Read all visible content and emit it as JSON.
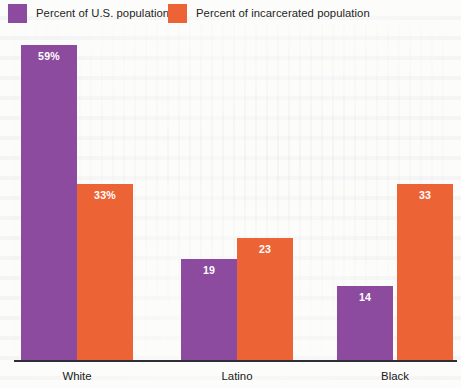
{
  "chart_data": {
    "type": "bar",
    "title": "",
    "subtitle": "",
    "xlabel": "",
    "ylabel": "",
    "grid": false,
    "legend_position": "top-left",
    "ylim": [
      0,
      62
    ],
    "categories": [
      "White",
      "Latino",
      "Black"
    ],
    "series": [
      {
        "name": "Percent of U.S. population",
        "color": "#8c4b9e",
        "values": [
          59,
          19,
          14
        ],
        "labels": [
          "59%",
          "19",
          "14"
        ]
      },
      {
        "name": "Percent of incarcerated population",
        "color": "#ec6436",
        "values": [
          33,
          23,
          33
        ],
        "labels": [
          "33%",
          "23",
          "33"
        ]
      }
    ]
  },
  "legend": {
    "items": [
      {
        "label": "Percent of U.S. population",
        "color": "#8c4b9e",
        "swatch_name": "legend-swatch-purple"
      },
      {
        "label": "Percent of incarcerated population",
        "color": "#ec6436",
        "swatch_name": "legend-swatch-orange"
      }
    ]
  },
  "axis": {
    "categories": [
      "White",
      "Latino",
      "Black"
    ]
  },
  "colors": {
    "purple": "#8c4b9e",
    "orange": "#ec6436",
    "axis": "#2e2e34",
    "background": "#fcfcfa",
    "value_text": "#ffffff",
    "label_text": "#202020"
  },
  "bar_values": {
    "white_population": "59%",
    "white_incarcerated": "33%",
    "latino_population": "19",
    "latino_incarcerated": "23",
    "black_population": "14",
    "black_incarcerated": "33"
  }
}
